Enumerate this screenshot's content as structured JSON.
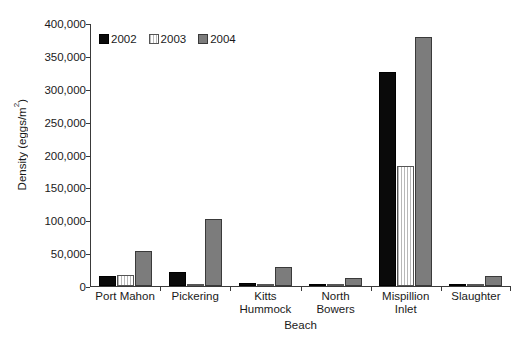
{
  "chart_data": {
    "type": "bar",
    "title": "",
    "xlabel": "Beach",
    "ylabel": "Density (eggs/m²)",
    "ylabel_main": "Density (eggs/m",
    "ylabel_sup": "2",
    "ylabel_tail": ")",
    "categories": [
      "Port Mahon",
      "Pickering",
      "Kitts Hummock",
      "North Bowers",
      "Mispillion Inlet",
      "Slaughter"
    ],
    "category_lines": [
      [
        "Port Mahon",
        ""
      ],
      [
        "Pickering",
        ""
      ],
      [
        "Kitts",
        "Hummock"
      ],
      [
        "North",
        "Bowers"
      ],
      [
        "Mispillion",
        "Inlet"
      ],
      [
        "Slaughter",
        ""
      ]
    ],
    "series": [
      {
        "name": "2002",
        "color": "#0a0a0a",
        "values": [
          15000,
          21000,
          5000,
          2000,
          325000,
          1500
        ]
      },
      {
        "name": "2003",
        "color": "#ffffff",
        "values": [
          17000,
          1500,
          2500,
          800,
          183000,
          3000
        ]
      },
      {
        "name": "2004",
        "color": "#7c7c7c",
        "values": [
          53000,
          102000,
          29000,
          12000,
          378000,
          15000
        ]
      }
    ],
    "ylim": [
      0,
      400000
    ],
    "yticks": [
      0,
      50000,
      100000,
      150000,
      200000,
      250000,
      300000,
      350000,
      400000
    ],
    "ytick_labels": [
      "0",
      "50,000",
      "100,000",
      "150,000",
      "200,000",
      "250,000",
      "300,000",
      "350,000",
      "400,000"
    ],
    "grid": false,
    "legend_position": "top-left-inside",
    "legend_entries": [
      "2002",
      "2003",
      "2004"
    ]
  }
}
